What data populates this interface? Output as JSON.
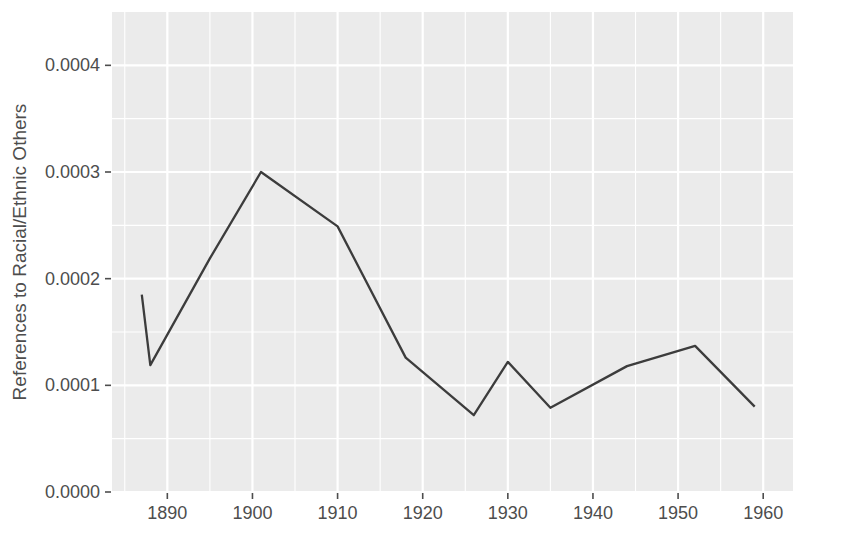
{
  "chart_data": {
    "type": "line",
    "title": "",
    "subtitle": "",
    "xlabel": "",
    "ylabel": "References to Racial/Ethnic Others",
    "xlim": [
      1883.5,
      1963.5
    ],
    "ylim": [
      0.0,
      0.00045
    ],
    "xticks": [
      1890,
      1900,
      1910,
      1920,
      1930,
      1940,
      1950,
      1960
    ],
    "xtick_labels": [
      "1890",
      "1900",
      "1910",
      "1920",
      "1930",
      "1940",
      "1950",
      "1960"
    ],
    "yticks": [
      0.0,
      0.0001,
      0.0002,
      0.0003,
      0.0004
    ],
    "ytick_labels": [
      "0.0000",
      "0.0001",
      "0.0002",
      "0.0003",
      "0.0004"
    ],
    "x_minor_ticks": [
      1885,
      1895,
      1905,
      1915,
      1925,
      1935,
      1945,
      1955
    ],
    "y_minor_ticks": [
      5e-05,
      0.00015,
      0.00025,
      0.00035
    ],
    "grid": true,
    "legend": false,
    "legend_position": "none",
    "series": [
      {
        "name": "References to Racial/Ethnic Others",
        "color": "#3c3c3c",
        "x": [
          1887,
          1888,
          1895,
          1901,
          1910,
          1918,
          1926,
          1930,
          1935,
          1944,
          1952,
          1959
        ],
        "values": [
          0.000185,
          0.000119,
          0.000219,
          0.0003,
          0.000249,
          0.000126,
          7.2e-05,
          0.000122,
          7.9e-05,
          0.000118,
          0.000137,
          8e-05
        ]
      }
    ],
    "panel_background": "#ebebeb",
    "gridline_color": "#ffffff",
    "text_color": "#4d4d4d"
  }
}
